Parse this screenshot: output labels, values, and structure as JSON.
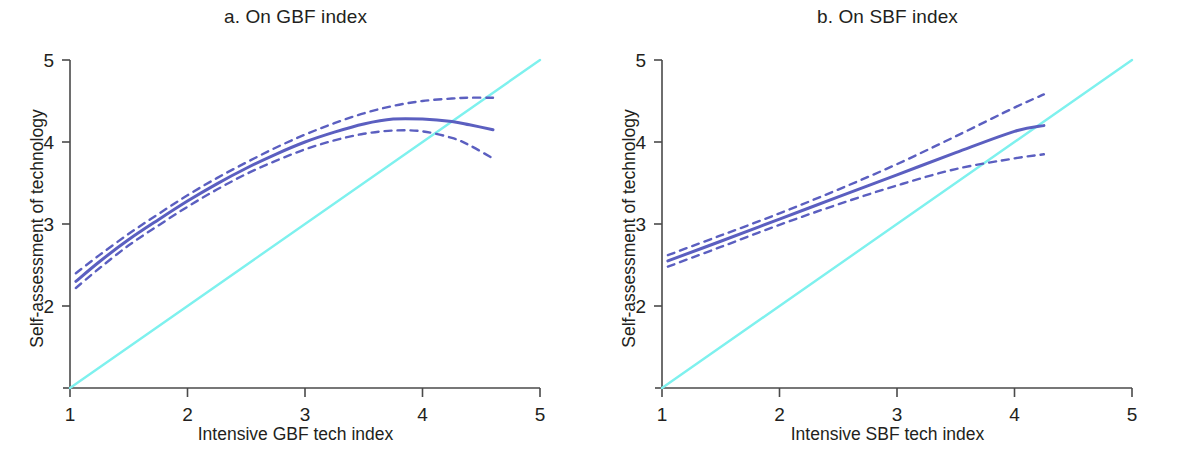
{
  "figure": {
    "panels": [
      {
        "id": "a",
        "title": "a. On GBF index",
        "xlabel": "Intensive GBF tech index",
        "ylabel": "Self-assessment of technology"
      },
      {
        "id": "b",
        "title": "b. On SBF index",
        "xlabel": "Intensive SBF tech index",
        "ylabel": "Self-assessment of technology"
      }
    ],
    "colors": {
      "fit_line": "#5b5fc0",
      "confidence_band": "#5b5fc0",
      "reference_line": "#7ef1ee",
      "axis": "#4a4a4a",
      "text": "#231f20",
      "background": "#ffffff"
    }
  },
  "chart_data": [
    {
      "type": "line",
      "panel": "a",
      "title": "a. On GBF index",
      "xlabel": "Intensive GBF tech index",
      "ylabel": "Self-assessment of technology",
      "xlim": [
        1,
        5
      ],
      "ylim": [
        1,
        5
      ],
      "xticks": [
        1,
        2,
        3,
        4,
        5
      ],
      "yticks": [
        1,
        2,
        3,
        4,
        5
      ],
      "xticklabels": [
        "1",
        "2",
        "3",
        "4",
        "5"
      ],
      "yticklabels": [
        "1",
        "2",
        "3",
        "4",
        "5"
      ],
      "grid": false,
      "legend": "none",
      "series": [
        {
          "name": "Fitted quadratic (GBF)",
          "style": "solid",
          "color": "#5b5fc0",
          "x": [
            1.05,
            1.25,
            1.5,
            1.75,
            2.0,
            2.25,
            2.5,
            2.75,
            3.0,
            3.25,
            3.5,
            3.75,
            4.0,
            4.25,
            4.4,
            4.6
          ],
          "values": [
            2.3,
            2.54,
            2.81,
            3.05,
            3.28,
            3.49,
            3.68,
            3.85,
            4.0,
            4.12,
            4.22,
            4.28,
            4.28,
            4.25,
            4.21,
            4.15
          ]
        },
        {
          "name": "Upper 95% confidence band (GBF)",
          "style": "dashed",
          "color": "#5b5fc0",
          "x": [
            1.05,
            1.25,
            1.5,
            1.75,
            2.0,
            2.25,
            2.5,
            2.75,
            3.0,
            3.25,
            3.5,
            3.75,
            4.0,
            4.25,
            4.4,
            4.6
          ],
          "values": [
            2.4,
            2.62,
            2.88,
            3.12,
            3.35,
            3.56,
            3.75,
            3.93,
            4.09,
            4.23,
            4.35,
            4.44,
            4.5,
            4.53,
            4.54,
            4.54
          ]
        },
        {
          "name": "Lower 95% confidence band (GBF)",
          "style": "dashed",
          "color": "#5b5fc0",
          "x": [
            1.05,
            1.25,
            1.5,
            1.75,
            2.0,
            2.25,
            2.5,
            2.75,
            3.0,
            3.25,
            3.5,
            3.75,
            4.0,
            4.25,
            4.4,
            4.6
          ],
          "values": [
            2.22,
            2.46,
            2.74,
            2.98,
            3.21,
            3.42,
            3.61,
            3.77,
            3.91,
            4.02,
            4.1,
            4.14,
            4.13,
            4.05,
            3.96,
            3.8
          ]
        },
        {
          "name": "45-degree reference line",
          "style": "solid",
          "color": "#7ef1ee",
          "x": [
            1,
            5
          ],
          "values": [
            1,
            5
          ]
        }
      ]
    },
    {
      "type": "line",
      "panel": "b",
      "title": "b. On SBF index",
      "xlabel": "Intensive SBF tech index",
      "ylabel": "Self-assessment of technology",
      "xlim": [
        1,
        5
      ],
      "ylim": [
        1,
        5
      ],
      "xticks": [
        1,
        2,
        3,
        4,
        5
      ],
      "yticks": [
        1,
        2,
        3,
        4,
        5
      ],
      "xticklabels": [
        "1",
        "2",
        "3",
        "4",
        "5"
      ],
      "yticklabels": [
        "1",
        "2",
        "3",
        "4",
        "5"
      ],
      "grid": false,
      "legend": "none",
      "series": [
        {
          "name": "Fitted line (SBF)",
          "style": "solid",
          "color": "#5b5fc0",
          "x": [
            1.05,
            1.5,
            2.0,
            2.5,
            3.0,
            3.5,
            4.0,
            4.25
          ],
          "values": [
            2.55,
            2.79,
            3.06,
            3.33,
            3.6,
            3.87,
            4.13,
            4.2
          ]
        },
        {
          "name": "Upper 95% confidence band (SBF)",
          "style": "dashed",
          "color": "#5b5fc0",
          "x": [
            1.05,
            1.5,
            2.0,
            2.5,
            3.0,
            3.5,
            4.0,
            4.25
          ],
          "values": [
            2.62,
            2.86,
            3.13,
            3.42,
            3.73,
            4.07,
            4.42,
            4.58
          ]
        },
        {
          "name": "Lower 95% confidence band (SBF)",
          "style": "dashed",
          "color": "#5b5fc0",
          "x": [
            1.05,
            1.5,
            2.0,
            2.5,
            3.0,
            3.5,
            4.0,
            4.25
          ],
          "values": [
            2.48,
            2.72,
            2.99,
            3.24,
            3.47,
            3.67,
            3.8,
            3.85
          ]
        },
        {
          "name": "45-degree reference line",
          "style": "solid",
          "color": "#7ef1ee",
          "x": [
            1,
            5
          ],
          "values": [
            1,
            5
          ]
        }
      ]
    }
  ]
}
